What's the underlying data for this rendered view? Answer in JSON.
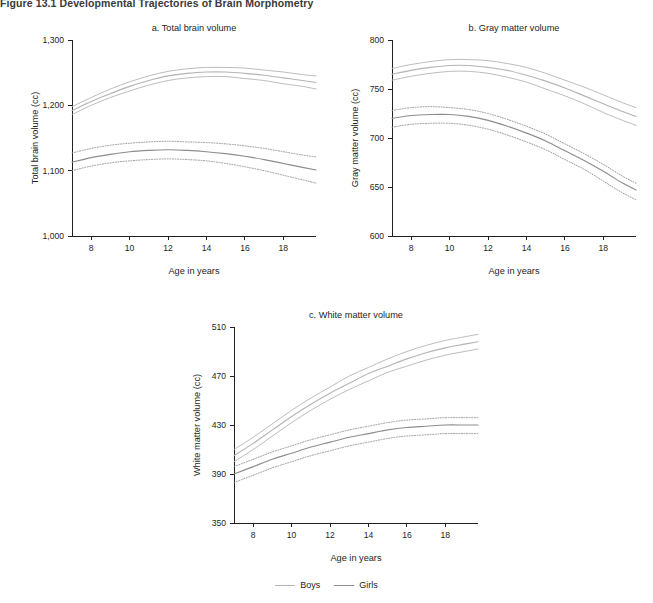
{
  "figure": {
    "title": "Figure 13.1  Developmental Trajectories of Brain Morphometry"
  },
  "legend": {
    "position": "bottom-center",
    "items": [
      {
        "label": "Boys",
        "color": "#b4b4b4",
        "style": "solid"
      },
      {
        "label": "Girls",
        "color": "#8d8d8d",
        "style": "solid"
      }
    ]
  },
  "axis_titles": {
    "x": "Age in years"
  },
  "chart_data": [
    {
      "id": "total-brain-volume",
      "type": "line",
      "title": "a. Total brain volume",
      "xlabel": "Age in years",
      "ylabel": "Total brain volume (cc)",
      "xlim": [
        7,
        19.7
      ],
      "ylim": [
        1000,
        1300
      ],
      "xticks": [
        8,
        10,
        12,
        14,
        16,
        18
      ],
      "yticks": [
        1000,
        1100,
        1200,
        1300
      ],
      "ytick_labels": [
        "1,000",
        "1,100",
        "1,200",
        "1,300"
      ],
      "grid": false,
      "x": [
        7,
        8,
        9,
        10,
        11,
        12,
        13,
        14,
        15,
        16,
        17,
        18,
        19,
        19.7
      ],
      "series": [
        {
          "name": "Boys",
          "color": "#b4b4b4",
          "style": "solid",
          "values": [
            1192,
            1206,
            1218,
            1229,
            1238,
            1245,
            1249,
            1251,
            1251,
            1249,
            1246,
            1242,
            1238,
            1235
          ],
          "ci_upper": [
            1198,
            1212,
            1225,
            1236,
            1245,
            1252,
            1256,
            1258,
            1258,
            1257,
            1254,
            1251,
            1247,
            1245
          ],
          "ci_lower": [
            1186,
            1200,
            1212,
            1222,
            1231,
            1238,
            1242,
            1244,
            1244,
            1241,
            1238,
            1233,
            1229,
            1225
          ],
          "ci_style": "solid"
        },
        {
          "name": "Girls",
          "color": "#8d8d8d",
          "style": "solid",
          "values": [
            1113,
            1120,
            1125,
            1129,
            1131,
            1132,
            1131,
            1129,
            1126,
            1122,
            1117,
            1111,
            1105,
            1101
          ],
          "ci_upper": [
            1127,
            1134,
            1139,
            1142,
            1144,
            1145,
            1144,
            1143,
            1141,
            1138,
            1134,
            1129,
            1124,
            1121
          ],
          "ci_lower": [
            1100,
            1107,
            1112,
            1115,
            1117,
            1118,
            1117,
            1115,
            1111,
            1106,
            1100,
            1093,
            1086,
            1081
          ],
          "ci_style": "dotted"
        }
      ]
    },
    {
      "id": "gray-matter-volume",
      "type": "line",
      "title": "b. Gray matter volume",
      "xlabel": "Age in years",
      "ylabel": "Gray matter volume (cc)",
      "xlim": [
        7,
        19.7
      ],
      "ylim": [
        600,
        800
      ],
      "xticks": [
        8,
        10,
        12,
        14,
        16,
        18
      ],
      "yticks": [
        600,
        650,
        700,
        750,
        800
      ],
      "ytick_labels": [
        "600",
        "650",
        "700",
        "750",
        "800"
      ],
      "grid": false,
      "x": [
        7,
        8,
        9,
        10,
        11,
        12,
        13,
        14,
        15,
        16,
        17,
        18,
        19,
        19.7
      ],
      "series": [
        {
          "name": "Boys",
          "color": "#b4b4b4",
          "style": "solid",
          "values": [
            765,
            769,
            772,
            774,
            774,
            772,
            769,
            764,
            758,
            751,
            743,
            735,
            727,
            722
          ],
          "ci_upper": [
            771,
            775,
            778,
            780,
            780,
            779,
            776,
            772,
            766,
            759,
            752,
            744,
            736,
            731
          ],
          "ci_lower": [
            759,
            763,
            766,
            768,
            768,
            766,
            762,
            757,
            750,
            743,
            735,
            726,
            718,
            713
          ],
          "ci_style": "solid"
        },
        {
          "name": "Girls",
          "color": "#8d8d8d",
          "style": "solid",
          "values": [
            720,
            723,
            724,
            724,
            722,
            718,
            712,
            705,
            697,
            687,
            677,
            666,
            654,
            647
          ],
          "ci_upper": [
            728,
            731,
            732,
            731,
            729,
            725,
            719,
            712,
            704,
            694,
            684,
            673,
            661,
            654
          ],
          "ci_lower": [
            711,
            714,
            715,
            715,
            713,
            709,
            703,
            696,
            688,
            678,
            668,
            656,
            644,
            637
          ],
          "ci_style": "dotted"
        }
      ]
    },
    {
      "id": "white-matter-volume",
      "type": "line",
      "title": "c. White matter volume",
      "xlabel": "Age in years",
      "ylabel": "White matter volume (cc)",
      "xlim": [
        7,
        19.7
      ],
      "ylim": [
        350,
        510
      ],
      "xticks": [
        8,
        10,
        12,
        14,
        16,
        18
      ],
      "yticks": [
        350,
        390,
        430,
        470,
        510
      ],
      "ytick_labels": [
        "350",
        "390",
        "430",
        "470",
        "510"
      ],
      "grid": false,
      "x": [
        7,
        8,
        9,
        10,
        11,
        12,
        13,
        14,
        15,
        16,
        17,
        18,
        19,
        19.7
      ],
      "series": [
        {
          "name": "Boys",
          "color": "#b4b4b4",
          "style": "solid",
          "values": [
            405,
            415,
            426,
            437,
            447,
            456,
            464,
            472,
            478,
            484,
            489,
            493,
            496,
            498
          ],
          "ci_upper": [
            410,
            420,
            431,
            442,
            452,
            461,
            470,
            477,
            484,
            490,
            495,
            499,
            502,
            504
          ],
          "ci_lower": [
            400,
            410,
            421,
            432,
            442,
            451,
            459,
            466,
            473,
            478,
            483,
            487,
            490,
            492
          ],
          "ci_style": "solid"
        },
        {
          "name": "Girls",
          "color": "#8d8d8d",
          "style": "solid",
          "values": [
            390,
            396,
            402,
            407,
            412,
            416,
            420,
            423,
            426,
            428,
            429,
            430,
            430,
            430
          ],
          "ci_upper": [
            396,
            402,
            408,
            413,
            418,
            422,
            426,
            429,
            432,
            434,
            435,
            436,
            436,
            436
          ],
          "ci_lower": [
            383,
            389,
            395,
            400,
            405,
            409,
            413,
            416,
            419,
            421,
            422,
            423,
            423,
            423
          ],
          "ci_style": "dotted"
        }
      ]
    }
  ]
}
